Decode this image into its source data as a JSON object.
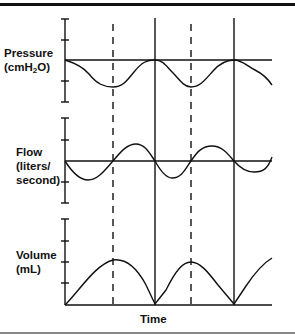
{
  "diagram": {
    "panels": [
      {
        "id": "pressure",
        "label_line1": "Pressure",
        "label_line2_prefix": "(cmH",
        "label_line2_sub": "2",
        "label_line2_suffix": "O)"
      },
      {
        "id": "flow",
        "label_line1": "Flow",
        "label_line2": "(liters/",
        "label_line3": "second)"
      },
      {
        "id": "volume",
        "label_line1": "Volume",
        "label_line2": "(mL)"
      }
    ],
    "x_axis_label": "Time",
    "markers": {
      "solid_lines": [
        "start of inspiration cycle 2",
        "start of inspiration cycle 3"
      ],
      "dashed_lines": [
        "end of inspiration cycle 1",
        "end of inspiration cycle 2"
      ]
    },
    "colors": {
      "stroke": "#111111",
      "background": "#ffffff",
      "bottom_rule": "#888888"
    }
  }
}
